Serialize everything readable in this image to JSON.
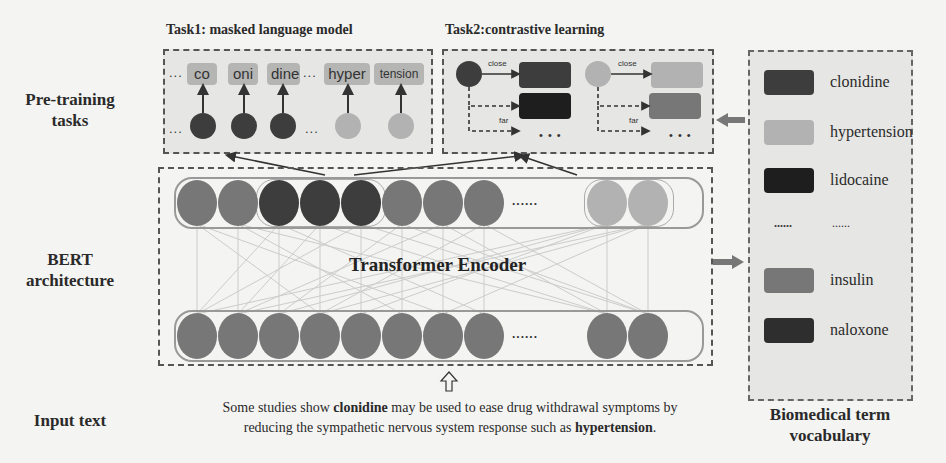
{
  "labels": {
    "pretraining": [
      "Pre-training",
      "tasks"
    ],
    "bert": [
      "BERT",
      "architecture"
    ],
    "input": "Input text",
    "vocab_title": [
      "Biomedical term",
      "vocabulary"
    ]
  },
  "task1": {
    "title": "Task1: masked language model",
    "tokens": [
      "co",
      "oni",
      "dine",
      "hyper",
      "tension"
    ],
    "ellipsis": "..."
  },
  "task2": {
    "title": "Task2:contrastive learning",
    "close_label": "close",
    "far_label": "far",
    "ellipsis": "• • •"
  },
  "encoder": {
    "title": "Transformer Encoder",
    "ellipsis": "......",
    "top_row_colors": [
      "#777777",
      "#777777",
      "#3d3d3d",
      "#3d3d3d",
      "#3d3d3d",
      "#777777",
      "#777777",
      "#777777",
      "#b2b2b2",
      "#b2b2b2"
    ],
    "bottom_row_count": 10
  },
  "vocabulary": {
    "items": [
      {
        "label": "clonidine",
        "color": "#3d3d3d"
      },
      {
        "label": "hypertension",
        "color": "#b2b2b2"
      },
      {
        "label": "lidocaine",
        "color": "#1e1e1e"
      },
      {
        "label": "......",
        "color": null,
        "swatch_text": "......"
      },
      {
        "label": "insulin",
        "color": "#777777"
      },
      {
        "label": "naloxone",
        "color": "#2e2e2e"
      }
    ]
  },
  "input_sentence": {
    "part1": "Some studies show ",
    "bold1": "clonidine",
    "part2": " may be used to ease drug withdrawal symptoms by",
    "part3": "reducing the sympathetic nervous system response such as ",
    "bold2": "hypertension",
    "part4": "."
  }
}
